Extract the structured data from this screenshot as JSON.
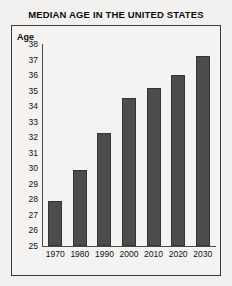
{
  "chart_data": {
    "type": "bar",
    "title": "MEDIAN AGE IN THE UNITED STATES",
    "xlabel": "",
    "ylabel": "Age",
    "categories": [
      "1970",
      "1980",
      "1990",
      "2000",
      "2010",
      "2020",
      "2030"
    ],
    "values": [
      27.9,
      29.9,
      32.3,
      34.5,
      35.2,
      36.0,
      37.2
    ],
    "ylim": [
      25,
      38
    ],
    "yticks": [
      25,
      26,
      27,
      28,
      29,
      30,
      31,
      32,
      33,
      34,
      35,
      36,
      37,
      38
    ],
    "ytick_labels": [
      "25",
      "26",
      "27",
      "28",
      "29",
      "30",
      "31",
      "32",
      "33",
      "34",
      "35",
      "36",
      "37",
      "38"
    ],
    "grid": false,
    "legend": null,
    "bar_color": "#4c4c4c",
    "frame_color": "#3a3a3a",
    "background_color": "#f2f1ef"
  }
}
